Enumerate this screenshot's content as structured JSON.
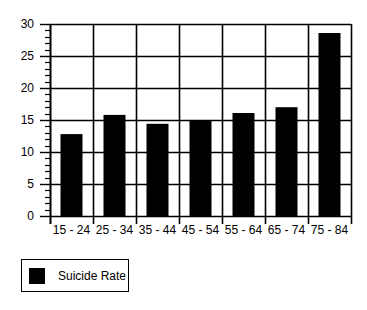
{
  "chart_data": {
    "type": "bar",
    "title": "",
    "xlabel": "",
    "ylabel": "",
    "categories": [
      "15 - 24",
      "25 - 34",
      "35 - 44",
      "45 - 54",
      "55 - 64",
      "65 - 74",
      "75 - 84"
    ],
    "series": [
      {
        "name": "Suicide Rate",
        "values": [
          12.8,
          15.8,
          14.4,
          15.0,
          16.1,
          17.0,
          28.6
        ],
        "color": "#000000"
      }
    ],
    "ylim": [
      0,
      30
    ],
    "yticks": [
      0,
      5,
      10,
      15,
      20,
      25,
      30
    ],
    "y_minor_step": 1,
    "grid": true,
    "legend_position": "bottom-left"
  },
  "legend": {
    "items": [
      {
        "label": "Suicide Rate",
        "color": "#000000"
      }
    ]
  }
}
